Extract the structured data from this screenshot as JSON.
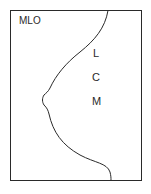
{
  "diagram": {
    "view_label": "MLO",
    "zones": [
      {
        "label": "L",
        "x": 93,
        "y": 48
      },
      {
        "label": "C",
        "x": 92,
        "y": 72
      },
      {
        "label": "M",
        "x": 92,
        "y": 96
      }
    ],
    "colors": {
      "frame": "#2a2a2a",
      "outline": "#2a2a2a",
      "background": "#ffffff"
    }
  }
}
